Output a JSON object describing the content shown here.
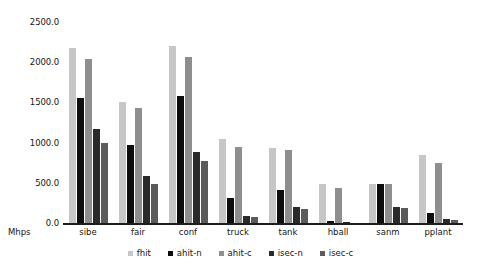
{
  "chart_data": {
    "type": "bar",
    "title": "",
    "xlabel": "Mhps",
    "ylabel": "",
    "ylim": [
      0,
      2500
    ],
    "grid": false,
    "legend_position": "bottom",
    "yticks": [
      "0.0",
      "500.0",
      "1000.0",
      "1500.0",
      "2000.0",
      "2500.0"
    ],
    "ytick_values": [
      0,
      500,
      1000,
      1500,
      2000,
      2500
    ],
    "categories": [
      "sibe",
      "fair",
      "conf",
      "truck",
      "tank",
      "hball",
      "sanm",
      "pplant"
    ],
    "series": [
      {
        "name": "fhit",
        "color": "#c6c6c6",
        "values": [
          2180,
          1500,
          2200,
          1050,
          930,
          485,
          490,
          840
        ]
      },
      {
        "name": "ahit-n",
        "color": "#0d0d0d",
        "values": [
          1550,
          975,
          1580,
          310,
          415,
          30,
          490,
          130
        ]
      },
      {
        "name": "ahit-c",
        "color": "#8e8e8e",
        "values": [
          2040,
          1430,
          2060,
          950,
          910,
          440,
          480,
          750
        ]
      },
      {
        "name": "isec-n",
        "color": "#2a2a2a",
        "values": [
          1170,
          580,
          880,
          90,
          195,
          8,
          200,
          45
        ]
      },
      {
        "name": "isec-c",
        "color": "#5b5b5b",
        "values": [
          990,
          480,
          770,
          75,
          180,
          6,
          190,
          40
        ]
      }
    ]
  }
}
